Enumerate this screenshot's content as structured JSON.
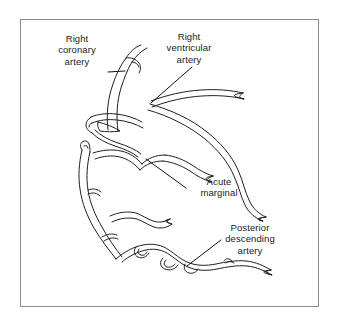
{
  "figure": {
    "kind": "anatomical-line-diagram",
    "frame": {
      "border_color": "#8b8b8b",
      "background_color": "#ffffff",
      "x": 20,
      "y": 19,
      "width": 299,
      "height": 288
    },
    "style": {
      "vessel_stroke_color": "#1f1f1f",
      "vessel_stroke_width": 1,
      "vessel_rendering": "double-outline tubes, tapering toward distal tips",
      "leader_stroke_color": "#111111",
      "text_color": "#1a1a1a",
      "font_size_px": 9.5
    }
  },
  "labels": [
    {
      "id": "right-coronary-artery",
      "lines": [
        "Right",
        "coronary",
        "artery"
      ],
      "line1": "Right",
      "line2": "coronary",
      "line3": "artery",
      "leader": "horizontal tick from right edge of text to proximal vessel trunk",
      "position": {
        "x": 46,
        "y": 33
      }
    },
    {
      "id": "right-ventricular-artery",
      "lines": [
        "Right",
        "ventricular",
        "artery"
      ],
      "line1": "Right",
      "line2": "ventricular",
      "line3": "artery",
      "leader": "diagonal pointer from lower-left of text down-left to vessel bifurcation",
      "position": {
        "x": 153,
        "y": 31
      }
    },
    {
      "id": "acute-marginal",
      "lines": [
        "Acute",
        "marginal"
      ],
      "line1": "Acute",
      "line2": "marginal",
      "leader": "diagonal pointer up-left to the acute marginal branch",
      "position": {
        "x": 188,
        "y": 176
      }
    },
    {
      "id": "posterior-descending-artery",
      "lines": [
        "Posterior",
        "descending",
        "artery"
      ],
      "line1": "Posterior",
      "line2": "descending",
      "line3": "artery",
      "leader": "diagonal pointer down-left to the posterior descending artery",
      "position": {
        "x": 211,
        "y": 222
      }
    }
  ],
  "vessel_paths": {
    "note": "Descriptive only; geometry lives in the SVG template.",
    "segments": [
      "proximal right coronary artery ascending at upper-left",
      "right ventricular artery sweeping to the upper right",
      "triangular anastomotic loop near the proximal bifurcation",
      "long right marginal trunk descending along the left border",
      "acute marginal branch running right across mid-field",
      "posterior descending artery with tortuous branches along the lower border"
    ]
  }
}
